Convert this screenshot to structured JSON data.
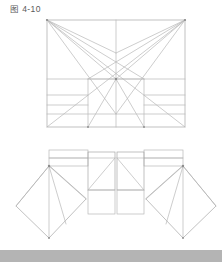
{
  "figure": {
    "caption": "图 4-10",
    "caption_label": "图",
    "caption_number": "4-10"
  },
  "colors": {
    "background": "#ffffff",
    "line": "#b8b8b8",
    "line_strong": "#a6a6a6",
    "node": "#8c8c8c",
    "caption_text": "#5a5a5a",
    "bottom_bar": "#b4b4b4"
  },
  "diagram": {
    "type": "technical-line-drawing",
    "title": "图 4-10",
    "views": [
      {
        "name": "upper-view",
        "label": "perspective-rectangle-with-radiating-construction-lines",
        "bounds": {
          "x": 47,
          "y": 20,
          "width": 138,
          "height": 107
        },
        "nodes": [
          {
            "name": "corner-top-left",
            "x": 47,
            "y": 20
          },
          {
            "name": "corner-top-right",
            "x": 185,
            "y": 20
          },
          {
            "name": "corner-bottom-left",
            "x": 47,
            "y": 127
          },
          {
            "name": "corner-bottom-right",
            "x": 185,
            "y": 127
          },
          {
            "name": "center-vanishing-node",
            "x": 116,
            "y": 79
          },
          {
            "name": "upper-mid-node",
            "x": 116,
            "y": 53
          },
          {
            "name": "lower-mid-node",
            "x": 116,
            "y": 114
          }
        ],
        "horizontal_bands_y": [
          79,
          95,
          105,
          114,
          127
        ],
        "vertical_dividers_x": [
          88,
          116,
          144
        ]
      },
      {
        "name": "lower-view",
        "label": "unfolded-net-with-two-fan-wings",
        "bounds": {
          "x": 14,
          "y": 148,
          "width": 194,
          "height": 96
        },
        "panels": [
          {
            "name": "left-fan-wing",
            "pivot_x": 49,
            "pivot_y": 166
          },
          {
            "name": "left-center-panel",
            "x": 88,
            "y": 152,
            "width": 27,
            "height": 85
          },
          {
            "name": "right-center-panel",
            "x": 117,
            "y": 152,
            "width": 27,
            "height": 85
          },
          {
            "name": "right-fan-wing",
            "pivot_x": 183,
            "pivot_y": 166
          }
        ],
        "top_strip_y": [
          150,
          158,
          166
        ],
        "panel_divider_y": [
          190,
          203
        ]
      }
    ]
  }
}
